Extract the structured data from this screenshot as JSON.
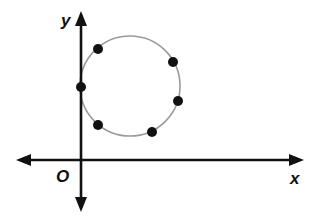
{
  "diagram": {
    "type": "coordinate-plane-circle",
    "axes": {
      "x_label": "x",
      "y_label": "y",
      "origin_label": "O",
      "color": "#111111"
    },
    "circle": {
      "center_px": [
        130,
        86
      ],
      "radius_px": 50,
      "stroke": "#9a9a9a"
    },
    "points": [
      {
        "name": "upper-left",
        "px": [
          98,
          49
        ]
      },
      {
        "name": "upper-right",
        "px": [
          173,
          62
        ]
      },
      {
        "name": "on-y-axis",
        "px": [
          81,
          87
        ]
      },
      {
        "name": "right",
        "px": [
          178,
          101
        ]
      },
      {
        "name": "lower-left",
        "px": [
          98,
          125
        ]
      },
      {
        "name": "lower-right",
        "px": [
          152,
          132
        ]
      }
    ],
    "point_color": "#111111"
  }
}
